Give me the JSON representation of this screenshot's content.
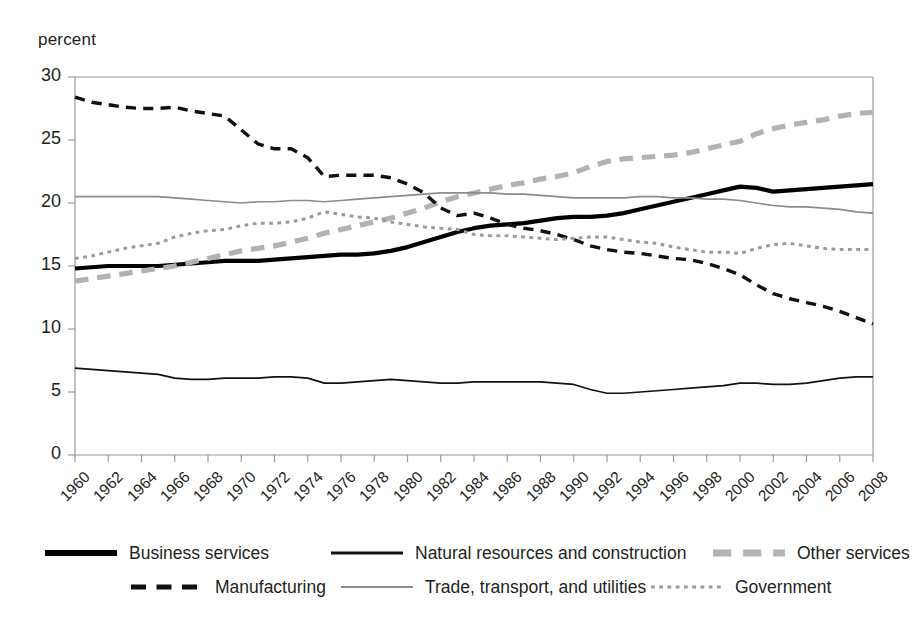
{
  "axis_title": "percent",
  "chart_data": {
    "type": "line",
    "title": "",
    "subtitle": "",
    "xlabel": "",
    "ylabel": "percent",
    "xlim": [
      1960,
      2008
    ],
    "ylim": [
      0,
      30
    ],
    "yticks": [
      0,
      5,
      10,
      15,
      20,
      25,
      30
    ],
    "xticks": [
      1960,
      1962,
      1964,
      1966,
      1968,
      1970,
      1972,
      1974,
      1976,
      1978,
      1980,
      1982,
      1984,
      1986,
      1988,
      1990,
      1992,
      1994,
      1996,
      1998,
      2000,
      2002,
      2004,
      2006,
      2008
    ],
    "grid": false,
    "legend_position": "bottom",
    "x": [
      1960,
      1961,
      1962,
      1963,
      1964,
      1965,
      1966,
      1967,
      1968,
      1969,
      1970,
      1971,
      1972,
      1973,
      1974,
      1975,
      1976,
      1977,
      1978,
      1979,
      1980,
      1981,
      1982,
      1983,
      1984,
      1985,
      1986,
      1987,
      1988,
      1989,
      1990,
      1991,
      1992,
      1993,
      1994,
      1995,
      1996,
      1997,
      1998,
      1999,
      2000,
      2001,
      2002,
      2003,
      2004,
      2005,
      2006,
      2007,
      2008
    ],
    "series": [
      {
        "name": "Business services",
        "style": "solid",
        "color": "#000000",
        "width": 4.2,
        "values": [
          14.8,
          14.9,
          15.0,
          15.0,
          15.0,
          15.0,
          15.1,
          15.2,
          15.3,
          15.4,
          15.4,
          15.4,
          15.5,
          15.6,
          15.7,
          15.8,
          15.9,
          15.9,
          16.0,
          16.2,
          16.5,
          16.9,
          17.3,
          17.7,
          18.0,
          18.2,
          18.3,
          18.4,
          18.6,
          18.8,
          18.9,
          18.9,
          19.0,
          19.2,
          19.5,
          19.8,
          20.1,
          20.4,
          20.7,
          21.0,
          21.3,
          21.2,
          20.9,
          21.0,
          21.1,
          21.2,
          21.3,
          21.4,
          21.5
        ]
      },
      {
        "name": "Natural resources and construction",
        "style": "solid",
        "color": "#111111",
        "width": 1.7,
        "values": [
          6.9,
          6.8,
          6.7,
          6.6,
          6.5,
          6.4,
          6.1,
          6.0,
          6.0,
          6.1,
          6.1,
          6.1,
          6.2,
          6.2,
          6.1,
          5.7,
          5.7,
          5.8,
          5.9,
          6.0,
          5.9,
          5.8,
          5.7,
          5.7,
          5.8,
          5.8,
          5.8,
          5.8,
          5.8,
          5.7,
          5.6,
          5.2,
          4.9,
          4.9,
          5.0,
          5.1,
          5.2,
          5.3,
          5.4,
          5.5,
          5.7,
          5.7,
          5.6,
          5.6,
          5.7,
          5.9,
          6.1,
          6.2,
          6.2
        ]
      },
      {
        "name": "Other services",
        "style": "dashed-thick",
        "color": "#b2b2b2",
        "width": 5.2,
        "values": [
          13.8,
          14.0,
          14.2,
          14.4,
          14.6,
          14.8,
          15.0,
          15.3,
          15.6,
          15.9,
          16.2,
          16.4,
          16.6,
          16.9,
          17.2,
          17.6,
          17.9,
          18.2,
          18.5,
          18.8,
          19.2,
          19.6,
          20.1,
          20.5,
          20.8,
          21.1,
          21.4,
          21.6,
          21.9,
          22.1,
          22.4,
          22.9,
          23.3,
          23.5,
          23.6,
          23.7,
          23.8,
          24.0,
          24.3,
          24.6,
          24.9,
          25.5,
          25.9,
          26.2,
          26.4,
          26.6,
          26.9,
          27.1,
          27.2
        ]
      },
      {
        "name": "Manufacturing",
        "style": "dashed",
        "color": "#111111",
        "width": 3.4,
        "values": [
          28.4,
          28.0,
          27.8,
          27.6,
          27.5,
          27.5,
          27.6,
          27.3,
          27.1,
          26.9,
          25.8,
          24.7,
          24.3,
          24.3,
          23.6,
          22.1,
          22.2,
          22.2,
          22.2,
          22.0,
          21.5,
          20.8,
          19.6,
          19.0,
          19.2,
          18.8,
          18.3,
          18.0,
          17.8,
          17.5,
          17.1,
          16.6,
          16.3,
          16.1,
          16.0,
          15.8,
          15.6,
          15.5,
          15.2,
          14.8,
          14.3,
          13.5,
          12.8,
          12.4,
          12.1,
          11.8,
          11.4,
          10.9,
          10.4
        ]
      },
      {
        "name": "Trade, transport, and utilities",
        "style": "solid",
        "color": "#8c8c8c",
        "width": 1.7,
        "values": [
          20.5,
          20.5,
          20.5,
          20.5,
          20.5,
          20.5,
          20.4,
          20.3,
          20.2,
          20.1,
          20.0,
          20.1,
          20.1,
          20.2,
          20.2,
          20.1,
          20.2,
          20.3,
          20.4,
          20.5,
          20.6,
          20.7,
          20.8,
          20.8,
          20.8,
          20.8,
          20.7,
          20.7,
          20.6,
          20.5,
          20.4,
          20.4,
          20.4,
          20.4,
          20.5,
          20.5,
          20.4,
          20.4,
          20.3,
          20.3,
          20.2,
          20.0,
          19.8,
          19.7,
          19.7,
          19.6,
          19.5,
          19.3,
          19.2
        ]
      },
      {
        "name": "Government",
        "style": "dotted",
        "color": "#9a9a9a",
        "width": 3.0,
        "values": [
          15.6,
          15.8,
          16.1,
          16.4,
          16.6,
          16.8,
          17.3,
          17.6,
          17.8,
          17.9,
          18.2,
          18.4,
          18.4,
          18.5,
          18.8,
          19.3,
          19.1,
          18.9,
          18.8,
          18.5,
          18.3,
          18.1,
          18.0,
          17.9,
          17.5,
          17.4,
          17.4,
          17.3,
          17.2,
          17.1,
          17.2,
          17.3,
          17.3,
          17.1,
          16.9,
          16.8,
          16.5,
          16.3,
          16.1,
          16.1,
          16.0,
          16.4,
          16.7,
          16.8,
          16.6,
          16.4,
          16.3,
          16.3,
          16.3
        ]
      }
    ]
  },
  "legend": {
    "items": [
      {
        "label": "Business services",
        "style": "solid",
        "color": "#000000",
        "width": 6
      },
      {
        "label": "Natural resources and construction",
        "style": "solid",
        "color": "#111111",
        "width": 3
      },
      {
        "label": "Other services",
        "style": "dashed-thick",
        "color": "#b2b2b2",
        "width": 7
      },
      {
        "label": "Manufacturing",
        "style": "dashed",
        "color": "#111111",
        "width": 5
      },
      {
        "label": "Trade, transport, and utilities",
        "style": "solid",
        "color": "#8c8c8c",
        "width": 2
      },
      {
        "label": "Government",
        "style": "dotted",
        "color": "#9a9a9a",
        "width": 3
      }
    ]
  },
  "plot_frame": {
    "left": 75,
    "right": 873,
    "top": 77,
    "bottom": 455,
    "border_color": "#9a9a9a"
  }
}
